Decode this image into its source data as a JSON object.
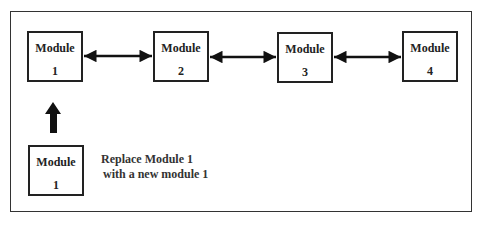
{
  "diagram": {
    "modules": [
      {
        "label": "Module",
        "number": "1"
      },
      {
        "label": "Module",
        "number": "2"
      },
      {
        "label": "Module",
        "number": "3"
      },
      {
        "label": "Module",
        "number": "4"
      }
    ],
    "replacement_module": {
      "label": "Module",
      "number": "1"
    },
    "caption": {
      "line1": "Replace Module 1",
      "line2": "with a new module 1"
    },
    "connections": [
      {
        "from": "Module 1",
        "to": "Module 2",
        "type": "bidirectional"
      },
      {
        "from": "Module 2",
        "to": "Module 3",
        "type": "bidirectional"
      },
      {
        "from": "Module 3",
        "to": "Module 4",
        "type": "bidirectional"
      },
      {
        "from": "Replacement Module 1",
        "to": "Module 1",
        "type": "thick-up-arrow"
      }
    ]
  }
}
